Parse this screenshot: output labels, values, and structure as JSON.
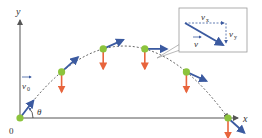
{
  "axes": {
    "x_label": "x",
    "y_label": "y",
    "origin_label": "0",
    "angle_label": "θ"
  },
  "initial_velocity": {
    "symbol": "v",
    "subscript": "0"
  },
  "inset": {
    "v_label": "v",
    "vx_symbol": "v",
    "vx_subscript": "x",
    "vy_symbol": "v",
    "vy_subscript": "y"
  },
  "colors": {
    "axis": "#555555",
    "velocity": "#3b5aa0",
    "gravity": "#e8643c",
    "point": "#8cc43c",
    "trajectory": "#555555",
    "inset_border": "#999999"
  },
  "points": [
    {
      "t": 0.0,
      "vel": [
        1.0,
        1.3
      ],
      "gravity": false
    },
    {
      "t": 0.2,
      "vel": [
        1.0,
        0.9
      ],
      "gravity": true
    },
    {
      "t": 0.4,
      "vel": [
        1.0,
        0.45
      ],
      "gravity": true
    },
    {
      "t": 0.6,
      "vel": [
        1.0,
        0.0
      ],
      "gravity": true
    },
    {
      "t": 0.8,
      "vel": [
        1.0,
        -0.45
      ],
      "gravity": true
    },
    {
      "t": 1.0,
      "vel": [
        1.0,
        -0.9
      ],
      "gravity": true
    }
  ]
}
